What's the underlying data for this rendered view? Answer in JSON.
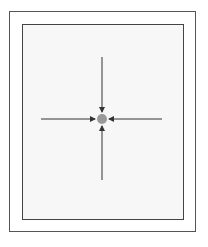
{
  "diagram": {
    "colors": {
      "outer_border": "#555555",
      "inner_border": "#444444",
      "inner_fill": "#f7f7f7",
      "dot": "#999999",
      "arrow": "#333333"
    },
    "center": {
      "x": 102,
      "y": 119,
      "radius": 5
    },
    "arrows": [
      {
        "direction": "down",
        "from": [
          102,
          57
        ],
        "to": [
          102,
          112
        ]
      },
      {
        "direction": "up",
        "from": [
          102,
          180
        ],
        "to": [
          102,
          126
        ]
      },
      {
        "direction": "right",
        "from": [
          41,
          119
        ],
        "to": [
          95,
          119
        ]
      },
      {
        "direction": "left",
        "from": [
          162,
          119
        ],
        "to": [
          109,
          119
        ]
      }
    ]
  }
}
